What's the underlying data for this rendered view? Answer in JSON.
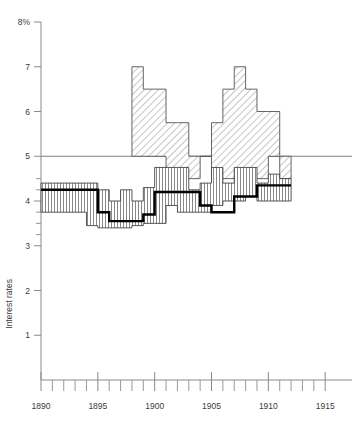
{
  "chart_data": {
    "type": "area",
    "title": "",
    "subtitle": "",
    "xlabel": "",
    "ylabel": "Interest rates",
    "xlim": [
      1890,
      1915.6
    ],
    "ylim": [
      0,
      8
    ],
    "grid": false,
    "legend_position": "none",
    "y_ticks_major": [
      1,
      2,
      3,
      4,
      5,
      6,
      7,
      8
    ],
    "y_tick_labels": [
      "1",
      "2",
      "3",
      "4",
      "5",
      "6",
      "7",
      "8%"
    ],
    "y_ticks_minor": [
      3.25,
      3.5,
      3.75,
      4.25,
      4.5
    ],
    "x_ticks_major": [
      1890,
      1895,
      1900,
      1905,
      1910,
      1915
    ],
    "x_tick_labels": [
      "1890",
      "1895",
      "1900",
      "1905",
      "1910",
      "1915"
    ],
    "x_ticks_minor": [
      1891,
      1892,
      1893,
      1894,
      1896,
      1897,
      1898,
      1899,
      1901,
      1902,
      1903,
      1904,
      1906,
      1907,
      1908,
      1909,
      1911,
      1912,
      1913,
      1914
    ],
    "annotations": [
      {
        "label": "5 percent reference line",
        "type": "hline",
        "y": 5,
        "x_from": 1890,
        "x_to": 1915.6
      }
    ],
    "series": [
      {
        "name": "Upper range band",
        "style": "diagonal-hatch",
        "kind": "step-band",
        "x": [
          1898,
          1899,
          1900,
          1901,
          1902,
          1903,
          1904,
          1905,
          1906,
          1907,
          1908,
          1909,
          1910,
          1911
        ],
        "upper": [
          7.0,
          6.5,
          6.5,
          5.75,
          5.75,
          5.0,
          5.0,
          5.75,
          6.5,
          7.0,
          6.5,
          6.0,
          6.0,
          5.0
        ],
        "lower": [
          5.0,
          5.0,
          5.0,
          4.5,
          4.5,
          4.5,
          5.0,
          4.5,
          4.5,
          4.5,
          4.5,
          4.5,
          5.0,
          4.5
        ]
      },
      {
        "name": "Lower range band",
        "style": "vertical-hatch",
        "kind": "step-band",
        "x": [
          1890,
          1891,
          1892,
          1893,
          1894,
          1895,
          1896,
          1897,
          1898,
          1899,
          1900,
          1901,
          1902,
          1903,
          1904,
          1905,
          1906,
          1907,
          1908,
          1909,
          1910,
          1911
        ],
        "upper": [
          4.4,
          4.4,
          4.4,
          4.4,
          4.4,
          4.25,
          4.0,
          4.25,
          4.0,
          4.3,
          4.75,
          4.75,
          4.75,
          4.25,
          4.4,
          4.75,
          4.4,
          4.75,
          4.75,
          4.4,
          4.6,
          4.5
        ],
        "lower": [
          3.75,
          3.75,
          3.75,
          3.75,
          3.45,
          3.4,
          3.4,
          3.4,
          3.45,
          3.5,
          3.5,
          3.9,
          3.75,
          3.75,
          3.75,
          3.9,
          4.0,
          4.0,
          4.1,
          4.0,
          4.0,
          4.0
        ]
      },
      {
        "name": "Average interest rate",
        "style": "thick-black-step",
        "kind": "step-line",
        "x": [
          1890,
          1891,
          1892,
          1893,
          1894,
          1895,
          1896,
          1897,
          1898,
          1899,
          1900,
          1901,
          1902,
          1903,
          1904,
          1905,
          1906,
          1907,
          1908,
          1909,
          1910,
          1911
        ],
        "y": [
          4.25,
          4.25,
          4.25,
          4.25,
          4.25,
          3.75,
          3.55,
          3.55,
          3.55,
          3.7,
          4.2,
          4.2,
          4.2,
          4.2,
          3.9,
          3.75,
          3.75,
          4.1,
          4.1,
          4.35,
          4.35,
          4.35
        ]
      }
    ]
  },
  "plot": {
    "left": 41,
    "right": 332,
    "top": 22,
    "bottom": 380
  }
}
